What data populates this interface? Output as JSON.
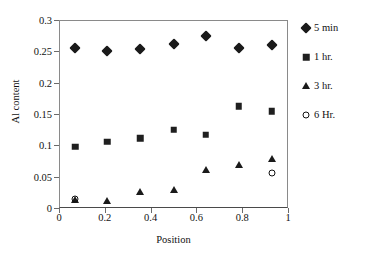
{
  "chart_data": {
    "type": "scatter",
    "title": "",
    "xlabel": "Position",
    "ylabel": "Al content",
    "xlim": [
      0,
      1
    ],
    "ylim": [
      0,
      0.3
    ],
    "xticks": [
      "0",
      "0.2",
      "0.4",
      "0.6",
      "0.8",
      "1"
    ],
    "xtick_values": [
      0,
      0.2,
      0.4,
      0.6,
      0.8,
      1
    ],
    "yticks": [
      "0",
      "0.05",
      "0.1",
      "0.15",
      "0.2",
      "0.25",
      "0.3"
    ],
    "ytick_values": [
      0,
      0.05,
      0.1,
      0.15,
      0.2,
      0.25,
      0.3
    ],
    "grid": false,
    "legend_position": "right",
    "series": [
      {
        "name": "5 min",
        "marker": "filled-diamond",
        "color": "#1a1a1a",
        "x": [
          0.07,
          0.21,
          0.355,
          0.5,
          0.64,
          0.785,
          0.93
        ],
        "values": [
          0.256,
          0.25,
          0.253,
          0.261,
          0.274,
          0.256,
          0.26
        ]
      },
      {
        "name": "1 hr.",
        "marker": "filled-square",
        "color": "#1f1f1f",
        "x": [
          0.07,
          0.21,
          0.355,
          0.5,
          0.64,
          0.785,
          0.93
        ],
        "values": [
          0.098,
          0.106,
          0.111,
          0.125,
          0.117,
          0.162,
          0.154
        ]
      },
      {
        "name": "3 hr.",
        "marker": "filled-triangle",
        "color": "#1a1a1a",
        "x": [
          0.07,
          0.21,
          0.355,
          0.5,
          0.64,
          0.785,
          0.93
        ],
        "values": [
          0.013,
          0.011,
          0.025,
          0.028,
          0.061,
          0.069,
          0.078
        ]
      },
      {
        "name": "6 Hr.",
        "marker": "open-circle",
        "color": "#111111",
        "x": [
          0.07,
          0.93
        ],
        "values": [
          0.014,
          0.056
        ]
      }
    ]
  }
}
